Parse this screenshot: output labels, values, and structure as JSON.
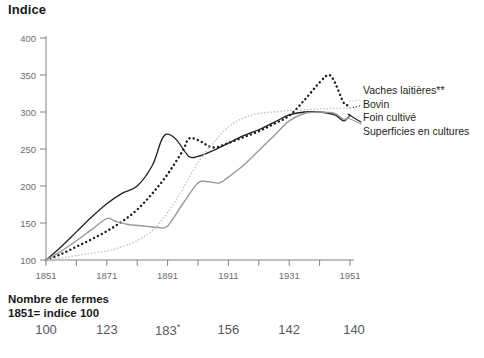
{
  "chart_data": {
    "type": "line",
    "title": "Indice",
    "xlabel": "",
    "ylabel": "Indice",
    "xlim": [
      1851,
      1951
    ],
    "ylim": [
      100,
      400
    ],
    "yticks": [
      100,
      150,
      200,
      250,
      300,
      350,
      400
    ],
    "xticks": [
      1851,
      1861,
      1871,
      1881,
      1891,
      1901,
      1911,
      1921,
      1931,
      1941,
      1951
    ],
    "xtick_labels_shown": [
      "1851",
      "1871",
      "1891",
      "1911",
      "1931",
      "1951"
    ],
    "grid": false,
    "legend_position": "right",
    "series": [
      {
        "name": "Vaches laitières**",
        "style": "dotted-thick-black",
        "color": "#1a1a1a",
        "x": [
          1851,
          1856,
          1861,
          1866,
          1871,
          1876,
          1881,
          1886,
          1891,
          1896,
          1898,
          1901,
          1906,
          1911,
          1916,
          1921,
          1926,
          1931,
          1936,
          1941,
          1944,
          1946,
          1949,
          1951
        ],
        "values": [
          100,
          108,
          118,
          128,
          139,
          152,
          168,
          190,
          216,
          248,
          264,
          262,
          252,
          258,
          266,
          274,
          284,
          295,
          316,
          340,
          350,
          340,
          312,
          310
        ]
      },
      {
        "name": "Bovin",
        "style": "solid-thin-black",
        "color": "#231f20",
        "x": [
          1851,
          1856,
          1861,
          1866,
          1871,
          1876,
          1881,
          1886,
          1889,
          1891,
          1894,
          1898,
          1901,
          1906,
          1911,
          1916,
          1921,
          1926,
          1931,
          1936,
          1941,
          1946,
          1949,
          1951
        ],
        "values": [
          100,
          118,
          138,
          158,
          176,
          190,
          200,
          228,
          262,
          270,
          262,
          240,
          240,
          248,
          258,
          268,
          276,
          286,
          296,
          300,
          300,
          296,
          288,
          296
        ]
      },
      {
        "name": "Foin cultivé",
        "style": "solid-thin-gray",
        "color": "#9a9a9a",
        "x": [
          1851,
          1856,
          1861,
          1866,
          1871,
          1874,
          1878,
          1883,
          1888,
          1891,
          1896,
          1901,
          1904,
          1908,
          1911,
          1916,
          1921,
          1926,
          1931,
          1936,
          1941,
          1946,
          1949,
          1951
        ],
        "values": [
          100,
          112,
          126,
          141,
          156,
          152,
          148,
          146,
          144,
          146,
          176,
          204,
          206,
          204,
          212,
          228,
          248,
          268,
          288,
          298,
          300,
          298,
          290,
          294
        ]
      },
      {
        "name": "Superficies en cultures",
        "style": "dotted-thin-lightgray",
        "color": "#c9c9c9",
        "x": [
          1851,
          1858,
          1864,
          1871,
          1876,
          1881,
          1886,
          1891,
          1896,
          1901,
          1906,
          1911,
          1916,
          1921,
          1926,
          1931,
          1936,
          1941,
          1946,
          1951
        ],
        "values": [
          100,
          104,
          108,
          112,
          118,
          126,
          140,
          164,
          196,
          232,
          258,
          280,
          292,
          298,
          300,
          302,
          303,
          304,
          305,
          305
        ]
      }
    ],
    "footnote_marker_in_legend": "**",
    "footer": {
      "title_line1": "Nombre de fermes",
      "title_line2": "1851= indice 100",
      "categories": [
        "1851",
        "1871",
        "1891",
        "1911",
        "1931",
        "1951"
      ],
      "values": [
        "100",
        "123",
        "183",
        "156",
        "142",
        "140"
      ],
      "value_markers": [
        "",
        "",
        "*",
        "",
        "",
        ""
      ]
    }
  },
  "title": "Indice",
  "legend": {
    "items": [
      {
        "label": "Vaches laitières**"
      },
      {
        "label": "Bovin"
      },
      {
        "label": "Foin cultivé"
      },
      {
        "label": "Superficies en cultures"
      }
    ]
  },
  "footer": {
    "line1": "Nombre de fermes",
    "line2": "1851= indice 100"
  }
}
